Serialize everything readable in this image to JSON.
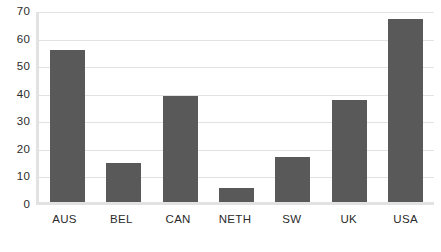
{
  "chart_data": {
    "type": "bar",
    "title": "",
    "subtitle": "",
    "xlabel": "",
    "ylabel": "",
    "categories": [
      "AUS",
      "BEL",
      "CAN",
      "NETH",
      "SW",
      "UK",
      "USA"
    ],
    "values": [
      55,
      14,
      38.5,
      5,
      16.5,
      37,
      66.5
    ],
    "series": [
      {
        "name": "",
        "values": [
          55,
          14,
          38.5,
          5,
          16.5,
          37,
          66.5
        ]
      }
    ],
    "ylim": [
      0,
      70
    ],
    "ytick_labels": [
      "70",
      "60",
      "50",
      "40",
      "30",
      "20",
      "10",
      "0"
    ],
    "ytick_values": [
      70,
      60,
      50,
      40,
      30,
      20,
      10,
      0
    ],
    "ytick_step": 10,
    "grid": true,
    "grid_axis": "y",
    "legend": false,
    "legend_position": "none",
    "annotations": [],
    "colors": {
      "bar_fill": "#595959",
      "gridline": "#e2e2e2",
      "axis_line": "#e2e2e2",
      "background": "#ffffff",
      "tick_label": "#2b2b2b"
    }
  }
}
